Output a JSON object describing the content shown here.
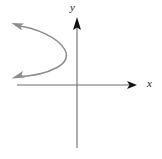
{
  "figure": {
    "background_color": "#ffffff",
    "width": 162,
    "height": 159,
    "axes": {
      "x_label": "x",
      "y_label": "y",
      "axis_color": "#4d4d4d",
      "arrow_color": "#1a1a1a",
      "origin": {
        "x": 77,
        "y": 85
      },
      "x_axis": {
        "start_x": 17,
        "end_x": 137,
        "y": 85,
        "arrow": "right"
      },
      "y_axis": {
        "x": 77,
        "start_y": 148,
        "end_y": 18,
        "arrow": "up"
      }
    },
    "curve": {
      "name": "leftward-opening-parabola",
      "color": "#8c8c8c",
      "stroke_width": 1.4,
      "vertex": {
        "x": 66,
        "y": 55
      },
      "upper_endpoint": {
        "x": 13,
        "y": 25
      },
      "lower_endpoint": {
        "x": 13,
        "y": 77
      },
      "arrow_heads": [
        "upper-left",
        "lower-left"
      ],
      "path": "M 14,25 C 34,27 58,36 65,50 C 68,57 66,62 58,67 C 46,73 28,76 14,77"
    }
  }
}
